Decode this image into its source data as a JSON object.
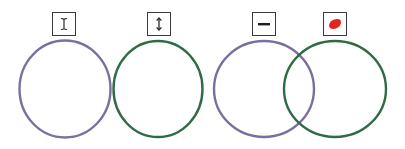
{
  "diagram": {
    "title": "",
    "colors": {
      "purple": "#7b6fa0",
      "green": "#2e6b46",
      "red": "#e0261e",
      "box_border": "#3a3a3a"
    },
    "panels": [
      {
        "id": "pair-1",
        "icons": [
          {
            "name": "text-cursor-icon",
            "glyph": "I-beam",
            "x": 52,
            "y": 12
          },
          {
            "name": "vertical-resize-icon",
            "glyph": "up-down-arrow",
            "x": 147,
            "y": 12
          }
        ],
        "circles": [
          {
            "name": "purple-circle",
            "cx": 65,
            "cy": 89,
            "rx": 46,
            "ry": 49,
            "color": "purple"
          },
          {
            "name": "green-circle",
            "cx": 158,
            "cy": 89,
            "rx": 45,
            "ry": 48,
            "color": "green"
          }
        ],
        "overlapping": false
      },
      {
        "id": "pair-2",
        "icons": [
          {
            "name": "minus-icon",
            "glyph": "horizontal-bar",
            "x": 252,
            "y": 12
          },
          {
            "name": "red-blob-icon",
            "glyph": "red-fill",
            "x": 323,
            "y": 12
          }
        ],
        "circles": [
          {
            "name": "purple-circle",
            "cx": 264,
            "cy": 89,
            "rx": 50,
            "ry": 48,
            "color": "purple"
          },
          {
            "name": "green-circle",
            "cx": 335,
            "cy": 89,
            "rx": 51,
            "ry": 48,
            "color": "green"
          }
        ],
        "overlapping": true
      }
    ]
  }
}
